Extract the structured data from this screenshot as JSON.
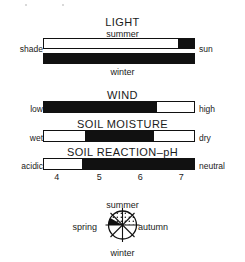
{
  "figure": {
    "kind": "ecological-indicator-bars",
    "background": "#ffffff",
    "ink": "#111111"
  },
  "sections": {
    "light": {
      "title": "LIGHT",
      "summer_label": "summer",
      "winter_label": "winter",
      "left_label": "shade",
      "right_label": "sun"
    },
    "wind": {
      "title": "WIND",
      "left_label": "low",
      "right_label": "high"
    },
    "soil_moisture": {
      "title": "SOIL MOISTURE",
      "left_label": "wet",
      "right_label": "dry"
    },
    "soil_reaction": {
      "title": "SOIL REACTION–pH",
      "left_label": "acidic",
      "right_label": "neutral"
    }
  },
  "ph_axis": {
    "ticks": [
      "4",
      "5",
      "6",
      "7"
    ],
    "tick_positions_pct": [
      9,
      37,
      64,
      91
    ]
  },
  "wheel": {
    "summer": "summer",
    "autumn": "autumn",
    "winter": "winter",
    "spring": "spring"
  },
  "chart_data": {
    "type": "bar",
    "orientation": "horizontal",
    "scale": "0–100% of each gradient axis",
    "series": [
      {
        "name": "LIGHT – summer",
        "axis_left": "shade",
        "axis_right": "sun",
        "fill_style": "black segment",
        "segments": [
          {
            "start_pct": 0,
            "end_pct": 89,
            "fill": "white"
          },
          {
            "start_pct": 89,
            "end_pct": 100,
            "fill": "black"
          }
        ]
      },
      {
        "name": "LIGHT – winter",
        "axis_left": "shade",
        "axis_right": "sun",
        "fill_style": "black segment",
        "segments": [
          {
            "start_pct": 0,
            "end_pct": 100,
            "fill": "black"
          }
        ]
      },
      {
        "name": "WIND",
        "axis_left": "low",
        "axis_right": "high",
        "fill_style": "black segment",
        "segments": [
          {
            "start_pct": 0,
            "end_pct": 75,
            "fill": "black"
          },
          {
            "start_pct": 75,
            "end_pct": 100,
            "fill": "white"
          }
        ]
      },
      {
        "name": "SOIL MOISTURE",
        "axis_left": "wet",
        "axis_right": "dry",
        "fill_style": "black segment",
        "segments": [
          {
            "start_pct": 0,
            "end_pct": 27,
            "fill": "white"
          },
          {
            "start_pct": 27,
            "end_pct": 73,
            "fill": "black"
          },
          {
            "start_pct": 73,
            "end_pct": 100,
            "fill": "white"
          }
        ]
      },
      {
        "name": "SOIL REACTION–pH",
        "axis_left": "acidic",
        "axis_right": "neutral",
        "fill_style": "black segment",
        "axis_ticks": [
          "4",
          "5",
          "6",
          "7"
        ],
        "segments": [
          {
            "start_pct": 0,
            "end_pct": 25,
            "fill": "white"
          },
          {
            "start_pct": 25,
            "end_pct": 100,
            "fill": "black"
          }
        ]
      }
    ],
    "wheel": {
      "type": "pie",
      "labels": [
        "summer",
        "autumn",
        "winter",
        "spring"
      ],
      "sectors": 8,
      "shaded_region": "upper-left sector solid black; upper sectors stippled"
    },
    "grid": false,
    "legend": "none"
  }
}
